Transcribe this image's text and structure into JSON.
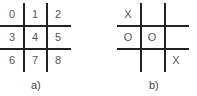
{
  "figure_a": {
    "caption": "a)",
    "cells": [
      "0",
      "1",
      "2",
      "3",
      "4",
      "5",
      "6",
      "7",
      "8"
    ]
  },
  "figure_b": {
    "caption": "b)",
    "cells": [
      "X",
      "",
      "",
      "O",
      "O",
      "",
      "",
      "",
      "X"
    ]
  }
}
